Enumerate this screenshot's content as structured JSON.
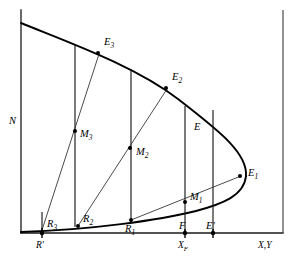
{
  "figure": {
    "type": "line-diagram",
    "background_color": "#ffffff",
    "line_color": "#000000"
  },
  "axes": {
    "y_label": "N",
    "x_label": "X,Y",
    "x_label_parts": {
      "first": "X",
      "sep": ",",
      "second": "Y"
    },
    "y_axis": {
      "x_px": 21,
      "y_top_px": 10,
      "y_bottom_px": 233
    },
    "x_axis": {
      "y_px": 233,
      "x_left_px": 21,
      "x_right_px": 283
    },
    "frame_right": {
      "x_px": 283,
      "y_top_px": 10,
      "y_bottom_px": 233
    }
  },
  "curve": {
    "name": "two-phase envelope",
    "upper_branch_start": {
      "x": 21,
      "y": 23
    },
    "nose": {
      "x": 246,
      "y": 161
    },
    "lower_branch_start": {
      "x": 21,
      "y": 232
    },
    "upper_points": [
      [
        21,
        23
      ],
      [
        60,
        40
      ],
      [
        98,
        53
      ],
      [
        133,
        69
      ],
      [
        166,
        88
      ],
      [
        196,
        112
      ],
      [
        219,
        139
      ],
      [
        238,
        160
      ],
      [
        246,
        176
      ]
    ],
    "lower_points": [
      [
        21,
        232
      ],
      [
        60,
        228
      ],
      [
        98,
        224
      ],
      [
        133,
        219
      ],
      [
        166,
        213
      ],
      [
        196,
        205
      ],
      [
        219,
        196
      ],
      [
        238,
        186
      ],
      [
        246,
        176
      ]
    ]
  },
  "axis_ticks": [
    {
      "name": "R-prime",
      "label": "R'",
      "x_px": 42,
      "axis": "x"
    },
    {
      "name": "X-F",
      "label": "X",
      "sub": "F",
      "x_px": 185,
      "axis": "x"
    },
    {
      "name": "E-prime-tick",
      "label": "",
      "x_px": 213,
      "axis": "x"
    }
  ],
  "points": [
    {
      "name": "E3",
      "label": "E",
      "sub": "3",
      "x": 98,
      "y": 53,
      "label_x": 104,
      "label_y": 44
    },
    {
      "name": "E2",
      "label": "E",
      "sub": "2",
      "x": 166,
      "y": 88,
      "label_x": 172,
      "label_y": 79
    },
    {
      "name": "E1",
      "label": "E",
      "sub": "1",
      "x": 240,
      "y": 176,
      "label_x": 248,
      "label_y": 174
    },
    {
      "name": "E",
      "label": "E",
      "sub": "",
      "x": 204,
      "y": 122,
      "label_x": 197,
      "label_y": 129
    },
    {
      "name": "M3",
      "label": "M",
      "sub": "3",
      "x": 75,
      "y": 131,
      "label_x": 80,
      "label_y": 137
    },
    {
      "name": "M2",
      "label": "M",
      "sub": "2",
      "x": 130,
      "y": 148,
      "label_x": 135,
      "label_y": 155
    },
    {
      "name": "M1",
      "label": "M",
      "sub": "1",
      "x": 185,
      "y": 202,
      "label_x": 190,
      "label_y": 199
    },
    {
      "name": "R3",
      "label": "R",
      "sub": "3",
      "x": 42,
      "y": 230,
      "label_x": 47,
      "label_y": 226
    },
    {
      "name": "R2",
      "label": "R",
      "sub": "2",
      "x": 78,
      "y": 226,
      "label_x": 83,
      "label_y": 221
    },
    {
      "name": "R1",
      "label": "R",
      "sub": "1",
      "x": 131,
      "y": 220,
      "label_x": 128,
      "label_y": 231
    },
    {
      "name": "F",
      "label": "F",
      "sub": "",
      "x": 185,
      "y": 233,
      "label_x": 180,
      "label_y": 228
    },
    {
      "name": "E-prime",
      "label": "E'",
      "sub": "",
      "x": 213,
      "y": 233,
      "label_x": 207,
      "label_y": 228
    }
  ],
  "vertical_lines": [
    {
      "name": "vline-R-prime",
      "x": 42,
      "y_top": 212,
      "y_bottom": 233
    },
    {
      "name": "vline-E3",
      "x": 75,
      "y_top": 45,
      "y_bottom": 227
    },
    {
      "name": "vline-E2",
      "x": 131,
      "y_top": 69,
      "y_bottom": 222
    },
    {
      "name": "vline-E",
      "x": 185,
      "y_top": 106,
      "y_bottom": 233
    },
    {
      "name": "vline-E-prime",
      "x": 213,
      "y_top": 110,
      "y_bottom": 233
    }
  ],
  "tie_lines": [
    {
      "name": "tieline-3",
      "from": "R3",
      "to": "E3",
      "x1": 42,
      "y1": 230,
      "x2": 99,
      "y2": 54
    },
    {
      "name": "tieline-2",
      "from": "R2",
      "to": "E2",
      "x1": 78,
      "y1": 226,
      "x2": 167,
      "y2": 89
    },
    {
      "name": "tieline-1",
      "from": "R1",
      "to": "E1",
      "x1": 131,
      "y1": 220,
      "x2": 241,
      "y2": 176
    }
  ],
  "labels": {
    "y_axis": "N",
    "x_axis": "X,Y",
    "r_prime": "R'",
    "x_f": "XF"
  }
}
